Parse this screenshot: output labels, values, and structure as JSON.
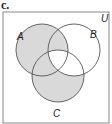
{
  "part_label": "c.",
  "universe_label": "U",
  "sets": [
    {
      "name": "A",
      "cx": 42,
      "cy": 50,
      "r": 26
    },
    {
      "name": "B",
      "cx": 74,
      "cy": 50,
      "r": 26
    },
    {
      "name": "C",
      "cx": 58,
      "cy": 76,
      "r": 26
    }
  ],
  "shaded_regions": [
    "A only",
    "A∩B only",
    "A∩C only",
    "C only"
  ],
  "unshaded_regions": [
    "B only",
    "B∩C only",
    "A∩B∩C",
    "outside"
  ],
  "colors": {
    "shade": "#d9d9d9",
    "stroke": "#555555",
    "frame": "#888888"
  }
}
